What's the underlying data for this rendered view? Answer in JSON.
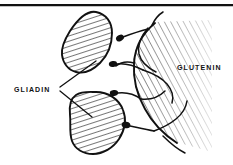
{
  "figure": {
    "background_color": "#ffffff",
    "ink_color": "#111111",
    "width": 233,
    "height": 165
  },
  "rule": {
    "name": "top-horizontal-rule",
    "y": 4,
    "thickness": 2.2,
    "color": "#111111"
  },
  "labels": {
    "gliadin": {
      "text": "GLIADIN",
      "x": 14,
      "y": 90
    },
    "glutenin": {
      "text": "GLUTENIN",
      "x": 177,
      "y": 70
    }
  },
  "gliadin_bodies": [
    {
      "name": "gliadin-body-upper",
      "path": "M 96 12 C 106 14 112 22 112 33 C 112 44 108 55 100 63 C 93 70 84 74 76 72 C 68 70 63 63 62 55 C 61 47 65 39 70 31 C 76 22 86 10 96 12 Z",
      "hatch": "hatch-steep"
    },
    {
      "name": "gliadin-body-lower",
      "path": "M 96 92 C 108 92 119 99 123 110 C 127 120 124 131 119 139 C 113 148 103 154 93 154 C 83 154 75 149 72 141 C 69 133 71 124 70 115 C 69 106 70 99 76 95 C 82 91 89 92 96 92 Z",
      "hatch": "hatch-steep"
    }
  ],
  "glutenin_mass": {
    "name": "glutenin-mass",
    "path": "M 156 22 C 142 32 134 46 133 62 C 132 78 136 94 144 108 C 151 121 162 133 176 142 L 212 152 L 212 20 Z",
    "hatch": "hatch-shallow"
  },
  "connectors": [
    {
      "name": "connector-node-1",
      "cx": 120,
      "cy": 38,
      "rx": 4.2,
      "ry": 3.0,
      "angle": -28,
      "link": "M 123 37 C 131 34 140 31 148 29"
    },
    {
      "name": "connector-node-2",
      "cx": 113,
      "cy": 64,
      "rx": 4.2,
      "ry": 3.0,
      "angle": -8,
      "link": "M 117 64 C 126 63 135 66 143 70"
    },
    {
      "name": "connector-node-3",
      "cx": 114,
      "cy": 93,
      "rx": 4.2,
      "ry": 3.0,
      "angle": -6,
      "link": "M 118 93 C 127 92 134 94 141 99"
    },
    {
      "name": "connector-node-4",
      "cx": 126,
      "cy": 125,
      "rx": 4.4,
      "ry": 3.2,
      "angle": 12,
      "link": "M 130 126 C 139 128 147 130 154 131"
    }
  ],
  "network_strands": [
    {
      "name": "strand-outer-boundary",
      "d": "M 155 23 C 143 33 135 47 134 63 C 133 79 137 95 145 109 C 152 122 163 134 177 143"
    },
    {
      "name": "strand-upper-branch",
      "d": "M 148 28 C 141 36 137 45 139 54 C 141 62 148 68 156 72"
    },
    {
      "name": "strand-mid-branch",
      "d": "M 143 70 C 152 73 161 77 167 84 C 172 90 174 97 172 103"
    },
    {
      "name": "strand-mid-loop",
      "d": "M 141 99 C 150 100 159 97 165 91"
    },
    {
      "name": "strand-lower-branch",
      "d": "M 154 131 C 162 128 170 124 176 119 C 182 114 186 108 187 101"
    },
    {
      "name": "strand-tail",
      "d": "M 163 136 C 170 143 177 149 185 153"
    },
    {
      "name": "strand-left-sprig",
      "d": "M 134 63 C 127 61 121 62 116 66"
    },
    {
      "name": "strand-top-sprig",
      "d": "M 152 25 C 155 19 158 15 163 12"
    }
  ],
  "leader_lines": [
    {
      "name": "leader-line-to-upper-gliadin",
      "d": "M 60 87 L 96 61"
    },
    {
      "name": "leader-line-to-lower-gliadin",
      "d": "M 60 91 L 92 117"
    }
  ]
}
